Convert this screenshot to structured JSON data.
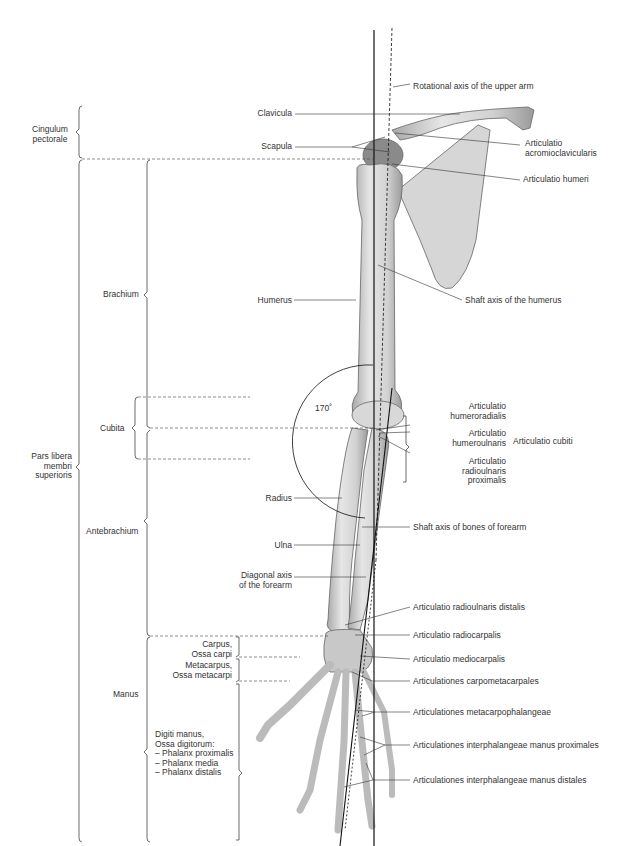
{
  "figure": {
    "left_regions": {
      "cingulum": "Cingulum\npectorale",
      "pars_libera": "Pars libera\nmembri\nsuperioris",
      "brachium": "Brachium",
      "cubita": "Cubita",
      "antebrachium": "Antebrachium",
      "manus": "Manus",
      "carpus": "Carpus,\nOssa carpi",
      "metacarpus": "Metacarpus,\nOssa metacarpi",
      "digiti": "Digiti manus,\nOssa digitorum:\n– Phalanx proximalis\n– Phalanx media\n– Phalanx distalis"
    },
    "bone_labels": {
      "clavicula": "Clavicula",
      "scapula": "Scapula",
      "humerus": "Humerus",
      "radius": "Radius",
      "ulna": "Ulna",
      "diagonal_axis": "Diagonal axis\nof the forearm",
      "angle": "170˚"
    },
    "right_labels": {
      "rotational_axis": "Rotational axis of the upper arm",
      "acromioclavicularis": "Articulatio\nacromioclavicularis",
      "humeri": "Articulatio humeri",
      "shaft_humerus": "Shaft axis of the humerus",
      "humeroradialis": "Articulatio\nhumeroradialis",
      "humeroulnaris": "Articulatio\nhumeroulnaris",
      "radioulnaris_prox": "Articulatio\nradioulnaris\nproximalis",
      "cubiti": "Articulatio cubiti",
      "shaft_forearm": "Shaft axis of bones of forearm",
      "radioulnaris_dist": "Articulatio radioulnaris distalis",
      "radiocarpalis": "Articulatio radiocarpalis",
      "mediocarpalis": "Articulatio mediocarpalis",
      "carpometacarpales": "Articulationes carpometacarpales",
      "metacarpophalangeae": "Articulationes metacarpophalangeae",
      "interphal_prox": "Articulationes interphalangeae manus proximales",
      "interphal_dist": "Articulationes interphalangeae manus distales"
    }
  }
}
